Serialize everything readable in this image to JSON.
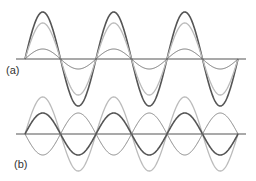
{
  "panels": [
    {
      "label": "(a)",
      "axis_y": 59,
      "waves": [
        {
          "name": "resultant",
          "amplitude": 47,
          "phase": 0,
          "color": "#555555",
          "width": 1.6
        },
        {
          "name": "component-large",
          "amplitude": 36,
          "phase": 0,
          "color": "#bbbbbb",
          "width": 1.3
        },
        {
          "name": "component-small",
          "amplitude": 10,
          "phase": 0,
          "color": "#777777",
          "width": 1.0
        }
      ]
    },
    {
      "label": "(b)",
      "axis_y": 134,
      "waves": [
        {
          "name": "component-large",
          "amplitude": 37,
          "phase": 0,
          "color": "#bbbbbb",
          "width": 1.3
        },
        {
          "name": "resultant",
          "amplitude": 21,
          "phase": 0,
          "color": "#555555",
          "width": 1.6
        },
        {
          "name": "component-inverted",
          "amplitude": 21,
          "phase": 180,
          "color": "#888888",
          "width": 1.0
        }
      ]
    }
  ],
  "geometry": {
    "axis_x_start": 16,
    "axis_x_end": 246,
    "wave_x_start": 25,
    "wave_x_end": 238,
    "half_period": 35.5
  },
  "colors": {
    "axis": "#555555"
  }
}
